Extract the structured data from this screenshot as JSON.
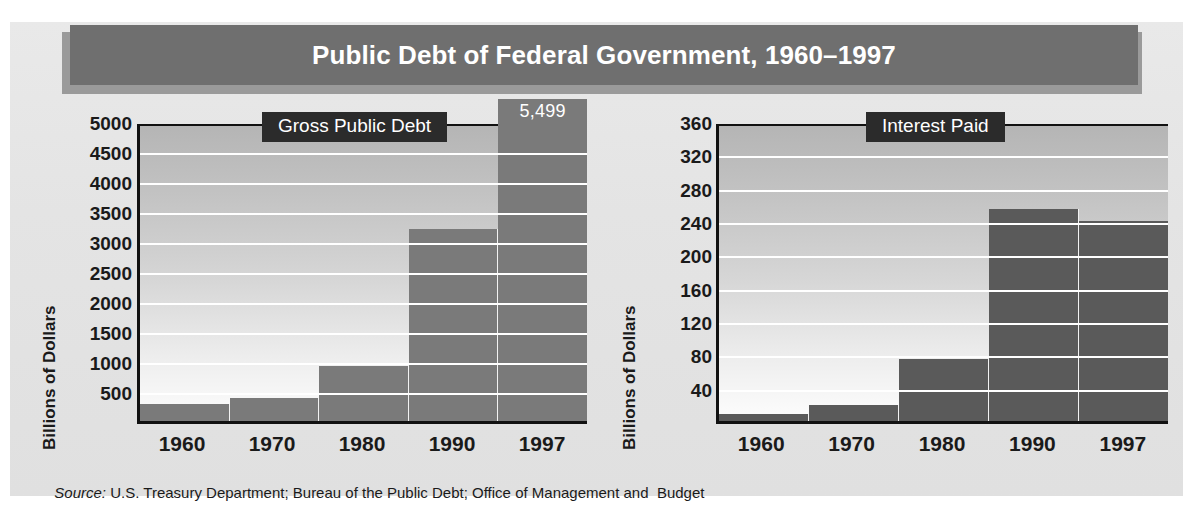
{
  "title": "Public Debt of Federal Government, 1960–1997",
  "source": {
    "lead": "Source:",
    "text": " U.S. Treasury Department; Bureau of the Public Debt; Office of Management and  Budget"
  },
  "colors": {
    "title_bar": "#6f6f6f",
    "title_shadow": "#9a9a9a",
    "panel": "#e4e4e4",
    "bar_left": "#7a7a7a",
    "bar_right": "#5a5a5a",
    "label_box": "#2b2b2b",
    "axis": "#111111",
    "gridline": "#ffffff"
  },
  "chart_data": [
    {
      "type": "bar",
      "title": "Gross Public Debt",
      "categories": [
        "1960",
        "1970",
        "1980",
        "1990",
        "1997"
      ],
      "values": [
        286,
        381,
        909,
        3207,
        5499
      ],
      "data_labels": [
        "",
        "",
        "",
        "",
        "5,499"
      ],
      "xlabel": "",
      "ylabel": "Billions of Dollars",
      "ylim": [
        0,
        5000
      ],
      "yticks": [
        5000,
        4500,
        4000,
        3500,
        3000,
        2500,
        2000,
        1500,
        1000,
        500
      ],
      "grid": true,
      "legend": "none"
    },
    {
      "type": "bar",
      "title": "Interest Paid",
      "categories": [
        "1960",
        "1970",
        "1980",
        "1990",
        "1997"
      ],
      "values": [
        9,
        19,
        75,
        255,
        240
      ],
      "data_labels": [
        "",
        "",
        "",
        "",
        ""
      ],
      "xlabel": "",
      "ylabel": "Billions of Dollars",
      "ylim": [
        0,
        360
      ],
      "yticks": [
        360,
        320,
        280,
        240,
        200,
        160,
        120,
        80,
        40
      ],
      "grid": true,
      "legend": "none"
    }
  ]
}
